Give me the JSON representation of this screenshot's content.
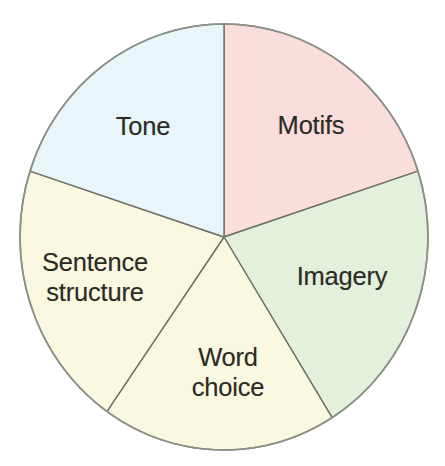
{
  "chart_data": {
    "type": "pie",
    "title": "",
    "subtitle": "",
    "xlabel": "",
    "ylabel": "",
    "legend_position": "none",
    "grid": false,
    "labels_inside_slices": true,
    "total_slices": 5,
    "categories": [
      "Motifs",
      "Imagery",
      "Word choice",
      "Sentence structure",
      "Tone"
    ],
    "values": [
      20,
      20,
      20,
      20,
      20
    ],
    "value_unit": "percent",
    "start_angle_deg": 0,
    "direction": "clockwise",
    "slices": [
      {
        "label": "Motifs",
        "value": 20,
        "sweep_deg": 72,
        "start_deg": 0,
        "end_deg": 72,
        "color": "#f9dedb",
        "label_x": 311,
        "label_y": 126
      },
      {
        "label": "Imagery",
        "value": 20,
        "sweep_deg": 76,
        "start_deg": 72,
        "end_deg": 148,
        "color": "#e2f0dc",
        "label_x": 342,
        "label_y": 277
      },
      {
        "label": "Word\nchoice",
        "value": 20,
        "sweep_deg": 67,
        "start_deg": 148,
        "end_deg": 215,
        "color": "#fbf8e2",
        "label_x": 228,
        "label_y": 373
      },
      {
        "label": "Sentence\nstructure",
        "value": 20,
        "sweep_deg": 73,
        "start_deg": 215,
        "end_deg": 288,
        "color": "#fbf8e2",
        "label_x": 95,
        "label_y": 278
      },
      {
        "label": "Tone",
        "value": 20,
        "sweep_deg": 72,
        "start_deg": 288,
        "end_deg": 360,
        "color": "#e8f6fa",
        "label_x": 143,
        "label_y": 127
      }
    ],
    "geometry": {
      "center_x": 224,
      "center_y": 237,
      "radius_x": 204,
      "radius_y": 213,
      "outline_color": "#8d9288",
      "divider_color": "#6e7168",
      "background_color": "#ffffff",
      "label_text_color": "#2b2b26"
    }
  }
}
